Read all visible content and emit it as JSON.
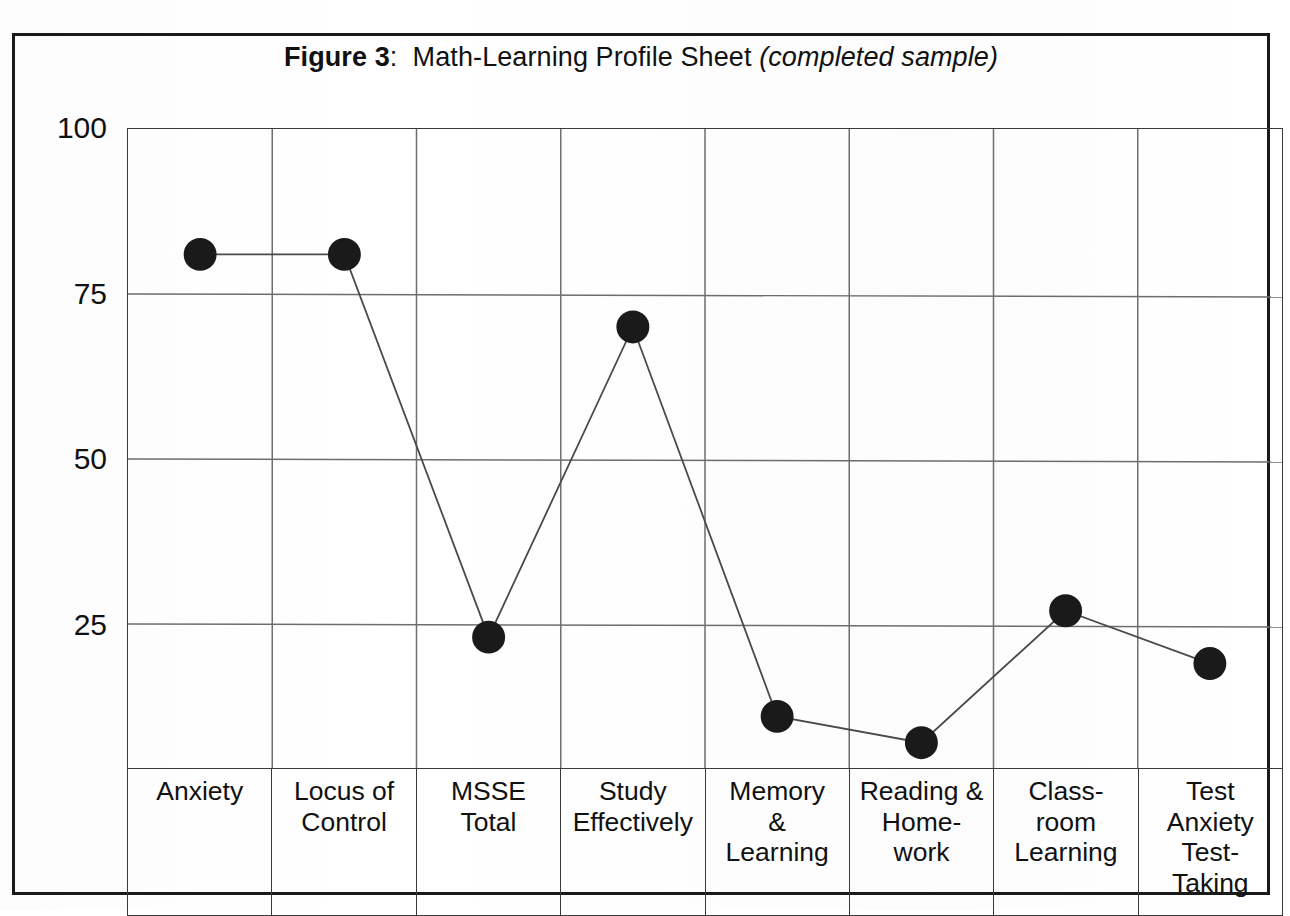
{
  "figure": {
    "title_label": "Figure 3",
    "title_separator": ":",
    "title_main": "Math-Learning Profile Sheet",
    "title_paren": "(completed sample)"
  },
  "axis": {
    "y_ticks": [
      "100",
      "75",
      "50",
      "25"
    ]
  },
  "chart_data": {
    "type": "line",
    "xlabel": "",
    "ylabel": "",
    "ylim": [
      0,
      100
    ],
    "yticks": [
      100,
      75,
      50,
      25
    ],
    "grid": true,
    "legend": "none",
    "marker": "filled-circle",
    "categories": [
      "Anxiety",
      "Locus of Control",
      "MSSE Total",
      "Study Effectively",
      "Memory & Learning",
      "Reading & Home-work",
      "Class-room Learning",
      "Test Anxiety Test-Taking"
    ],
    "category_lines": [
      [
        "Anxiety"
      ],
      [
        "Locus of",
        "Control"
      ],
      [
        "MSSE",
        "Total"
      ],
      [
        "Study",
        "Effectively"
      ],
      [
        "Memory",
        "&",
        "Learning"
      ],
      [
        "Reading &",
        "Home-",
        "work"
      ],
      [
        "Class-",
        "room",
        "Learning"
      ],
      [
        "Test",
        "Anxiety",
        "Test-",
        "Taking"
      ]
    ],
    "values": [
      81,
      81,
      23,
      70,
      11,
      7,
      27,
      19
    ],
    "series": [
      {
        "name": "Completed sample profile",
        "values": [
          81,
          81,
          23,
          70,
          11,
          7,
          27,
          19
        ]
      }
    ]
  },
  "colors": {
    "marker": "#1a1a1a",
    "line": "#4a4a4a",
    "grid": "#6e6e6e",
    "frame": "#1a1a1a",
    "text": "#111111"
  }
}
